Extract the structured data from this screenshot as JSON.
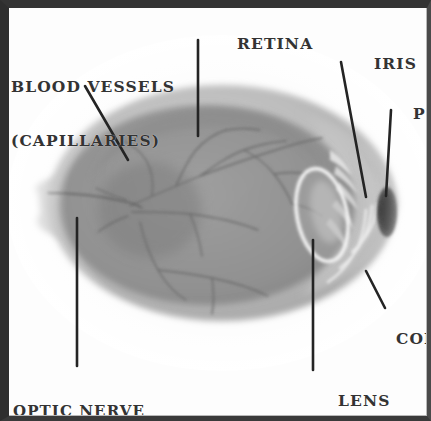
{
  "diagram": {
    "frame_color": "#2e2e2e",
    "background_color": "#fdfdfd",
    "label_color": "#333333",
    "leader_color": "#242424"
  },
  "labels": {
    "retina": "RETINA",
    "blood_vessels_line1": "BLOOD VESSELS",
    "blood_vessels_line2": "(CAPILLARIES)",
    "iris": "IRIS",
    "pupil": "PUPIL",
    "cornea": "CORNEA",
    "lens": "LENS",
    "optic_nerve_line1": "OPTIC NERVE",
    "optic_nerve_line2": "TO THE BRAIN"
  },
  "parts": [
    {
      "name": "retina",
      "label": "RETINA",
      "label_x": 186,
      "label_y": 18,
      "leader": "M198,40 L198,136"
    },
    {
      "name": "blood-vessels",
      "label": "BLOOD VESSELS",
      "label_x": 12,
      "label_y": 43,
      "leader": "M85,86 L128,160"
    },
    {
      "name": "iris",
      "label": "IRIS",
      "label_x": 322,
      "label_y": 38,
      "leader": "M341,62 L366,197"
    },
    {
      "name": "pupil",
      "label": "PUPIL",
      "label_x": 361,
      "label_y": 88,
      "leader": "M391,110 L386,196"
    },
    {
      "name": "cornea",
      "label": "CORNEA",
      "label_x": 345,
      "label_y": 313,
      "leader": "M366,271 L385,308"
    },
    {
      "name": "lens",
      "label": "LENS",
      "label_x": 287,
      "label_y": 375,
      "leader": "M313,240 L313,370"
    },
    {
      "name": "optic-nerve",
      "label": "OPTIC NERVE",
      "label_x": 14,
      "label_y": 369,
      "leader": "M77,218 L77,366"
    }
  ],
  "anatomy": {
    "eyeball": {
      "cx": 225,
      "cy": 203,
      "rx": 176,
      "ry": 119,
      "fill": "#a6a6a6"
    },
    "sclera_highlight": "#c2c2c2",
    "vitreous_fill": "#8f8f8f",
    "lens_outline_color": "#f4f4f4",
    "pupil_fill": "#3c3c3c",
    "vessel_color": "#6a6a6a",
    "optic_nerve_stalk": "#b0b0b0"
  },
  "colors": {
    "frame": "#2e2e2e",
    "paper": "#fdfdfd",
    "text": "#333333",
    "leader": "#242424",
    "eye_mid": "#9a9a9a",
    "eye_light": "#c9c9c9",
    "eye_dark": "#7d7d7d",
    "pupil": "#3c3c3c"
  }
}
